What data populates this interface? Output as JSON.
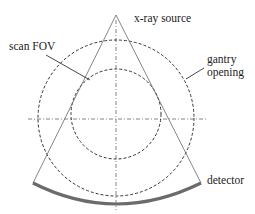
{
  "diagram": {
    "type": "CT scanner geometry schematic",
    "labels": {
      "source": "x-ray source",
      "scan_fov": "scan FOV",
      "gantry_line1": "gantry",
      "gantry_line2": "opening",
      "detector": "detector"
    },
    "geometry": {
      "center": [
        116,
        118
      ],
      "source_point": [
        116,
        15
      ],
      "gantry_opening_radius": 78,
      "scan_fov_radius": 46,
      "fan_left_end": [
        33,
        183
      ],
      "fan_right_end": [
        201,
        183
      ]
    },
    "colors": {
      "lines": "#555555",
      "dashed_circles": "#333333",
      "detector": "#6b6b6b",
      "text": "#222222"
    }
  }
}
